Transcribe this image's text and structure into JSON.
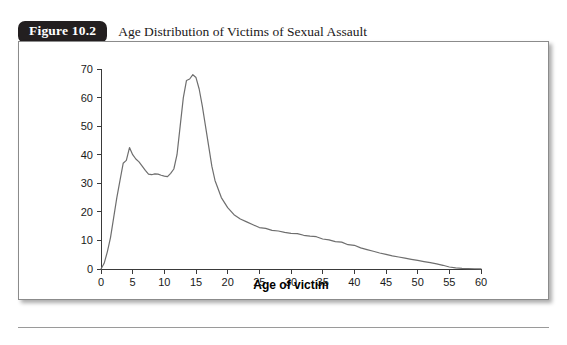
{
  "figure": {
    "tab_label": "Figure 10.2",
    "caption": "Age Distribution of Victims of Sexual Assault"
  },
  "chart_data": {
    "type": "line",
    "title": "Age Distribution of Victims of Sexual Assault",
    "xlabel": "Age of victim",
    "ylabel": "",
    "xlim": [
      0,
      60
    ],
    "ylim": [
      0,
      70
    ],
    "xticks": [
      0,
      5,
      10,
      15,
      20,
      25,
      30,
      35,
      40,
      45,
      50,
      55,
      60
    ],
    "yticks": [
      0,
      10,
      20,
      30,
      40,
      50,
      60,
      70
    ],
    "xtick_labels": [
      "0",
      "5",
      "10",
      "15",
      "20",
      "25",
      "30",
      "35",
      "40",
      "45",
      "50",
      "55",
      "60"
    ],
    "ytick_labels": [
      "0",
      "10",
      "20",
      "30",
      "40",
      "50",
      "60",
      "70"
    ],
    "grid": false,
    "legend": false,
    "line_color": "#6e6e6e",
    "series": [
      {
        "name": "Victims",
        "x": [
          0,
          0.5,
          1,
          1.5,
          2,
          2.5,
          3,
          3.5,
          4,
          4.5,
          5,
          5.5,
          6,
          6.5,
          7,
          7.5,
          8,
          8.5,
          9,
          9.5,
          10,
          10.5,
          11,
          11.5,
          12,
          12.5,
          13,
          13.5,
          14,
          14.5,
          15,
          15.5,
          16,
          16.5,
          17,
          17.5,
          18,
          19,
          20,
          21,
          22,
          23,
          24,
          25,
          26,
          27,
          28,
          29,
          30,
          31,
          32,
          33,
          34,
          35,
          36,
          37,
          38,
          39,
          40,
          41,
          42,
          43,
          44,
          45,
          46,
          47,
          48,
          49,
          50,
          51,
          52,
          53,
          54,
          55,
          56,
          57,
          58,
          59,
          60
        ],
        "y": [
          0,
          2,
          6,
          11,
          18,
          25,
          31,
          37,
          38,
          42.5,
          40,
          38.5,
          37.5,
          36,
          34.5,
          33.2,
          33,
          33.3,
          33.2,
          32.8,
          32.5,
          32.3,
          33.5,
          35,
          40,
          50,
          60,
          66,
          66.5,
          68,
          67,
          63,
          57,
          50,
          43,
          36,
          31,
          25,
          21.5,
          19,
          17.5,
          16.5,
          15.5,
          14.5,
          14.2,
          13.5,
          13.3,
          12.8,
          12.5,
          12.4,
          11.8,
          11.5,
          11.3,
          10.5,
          10.2,
          9.6,
          9.4,
          8.5,
          8.3,
          7.4,
          6.8,
          6.2,
          5.6,
          5.1,
          4.6,
          4.2,
          3.8,
          3.4,
          3.0,
          2.6,
          2.2,
          1.8,
          1.3,
          0.7,
          0.4,
          0.25,
          0.15,
          0.08,
          0.05
        ]
      }
    ],
    "annotations": {
      "first_peak": {
        "age": 4.5,
        "value": 42.5
      },
      "trough": {
        "age": 10,
        "value": 32.5
      },
      "main_peak": {
        "age": 14.5,
        "value": 68
      }
    }
  }
}
